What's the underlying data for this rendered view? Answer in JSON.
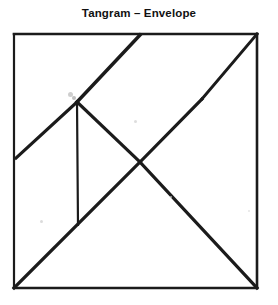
{
  "title": "Tangram – Envelope",
  "figure": {
    "name": "tangram-envelope-dissection",
    "background_color": "#ffffff",
    "stroke_color": "#1b1b1b",
    "canvas": {
      "width": 278,
      "height": 305
    },
    "square": {
      "left": 14,
      "top": 34,
      "right": 257,
      "bottom": 288
    },
    "points": {
      "top_left": [
        14,
        34
      ],
      "top_mid": [
        140,
        35
      ],
      "top_right": [
        257,
        34
      ],
      "bottom_left": [
        14,
        288
      ],
      "bottom_right": [
        257,
        288
      ],
      "left_mid": [
        16,
        158
      ],
      "center_junction": [
        77,
        102
      ],
      "right_vertex": [
        202,
        99
      ],
      "cross_point": [
        140,
        162
      ],
      "vertical_foot": [
        78,
        225
      ]
    },
    "segments": [
      {
        "name": "square-top-edge",
        "from": [
          14,
          34
        ],
        "to": [
          257,
          34
        ],
        "width": 2.6
      },
      {
        "name": "square-right-edge",
        "from": [
          257,
          34
        ],
        "to": [
          257,
          288
        ],
        "width": 2.6
      },
      {
        "name": "square-bottom-edge",
        "from": [
          257,
          288
        ],
        "to": [
          14,
          288
        ],
        "width": 2.6
      },
      {
        "name": "square-left-edge",
        "from": [
          14,
          288
        ],
        "to": [
          14,
          34
        ],
        "width": 2.2
      },
      {
        "name": "apex-to-junction",
        "from": [
          140,
          35
        ],
        "to": [
          77,
          102
        ],
        "width": 3.4
      },
      {
        "name": "junction-to-left-edge",
        "from": [
          77,
          102
        ],
        "to": [
          16,
          158
        ],
        "width": 3.2
      },
      {
        "name": "junction-to-cross",
        "from": [
          77,
          102
        ],
        "to": [
          140,
          162
        ],
        "width": 3.2
      },
      {
        "name": "cross-to-right-vertex",
        "from": [
          140,
          162
        ],
        "to": [
          202,
          99
        ],
        "width": 3.2
      },
      {
        "name": "right-vertex-to-top-right",
        "from": [
          202,
          99
        ],
        "to": [
          257,
          34
        ],
        "width": 3.0
      },
      {
        "name": "main-diagonal-bottom-left-to-cross",
        "from": [
          14,
          288
        ],
        "to": [
          140,
          162
        ],
        "width": 3.2
      },
      {
        "name": "cross-to-bottom-right",
        "from": [
          140,
          162
        ],
        "to": [
          257,
          288
        ],
        "width": 3.2
      },
      {
        "name": "vertical-divider",
        "from": [
          77,
          102
        ],
        "to": [
          78,
          225
        ],
        "width": 2.2
      }
    ],
    "specks": [
      {
        "name": "speck-upper-left",
        "x": 68,
        "y": 92,
        "size": 5,
        "color": "#bdbdbd"
      },
      {
        "name": "speck-junction-blot",
        "x": 72,
        "y": 96,
        "size": 4,
        "color": "#a8a8a8"
      },
      {
        "name": "speck-mid",
        "x": 134,
        "y": 120,
        "size": 3,
        "color": "#d2d2d2"
      },
      {
        "name": "speck-low-left",
        "x": 40,
        "y": 220,
        "size": 3,
        "color": "#cfcfcf"
      },
      {
        "name": "speck-low-right",
        "x": 170,
        "y": 196,
        "size": 2,
        "color": "#dadada"
      },
      {
        "name": "speck-right-edge",
        "x": 248,
        "y": 210,
        "size": 2,
        "color": "#dcdcdc"
      }
    ]
  }
}
